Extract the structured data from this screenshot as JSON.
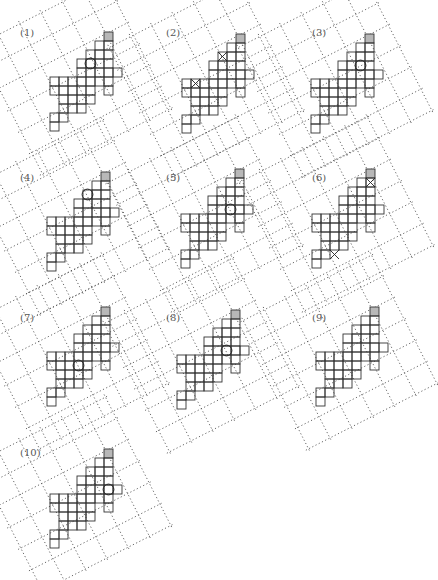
{
  "figure": {
    "cell_size": 9,
    "grid_color": "#555555",
    "cell_stroke": "#333333",
    "shaded_fill": "#b8b8b8",
    "shape_cells": [
      [
        0,
        0
      ],
      [
        -1,
        1
      ],
      [
        0,
        1
      ],
      [
        -2,
        2
      ],
      [
        -1,
        2
      ],
      [
        0,
        2
      ],
      [
        -3,
        3
      ],
      [
        -2,
        3
      ],
      [
        -1,
        3
      ],
      [
        0,
        3
      ],
      [
        -3,
        4
      ],
      [
        -2,
        4
      ],
      [
        -1,
        4
      ],
      [
        0,
        4
      ],
      [
        1,
        4
      ],
      [
        -6,
        5
      ],
      [
        -5,
        5
      ],
      [
        -4,
        5
      ],
      [
        -3,
        5
      ],
      [
        -2,
        5
      ],
      [
        -1,
        5
      ],
      [
        0,
        5
      ],
      [
        -6,
        6
      ],
      [
        -5,
        6
      ],
      [
        -4,
        6
      ],
      [
        -3,
        6
      ],
      [
        -2,
        6
      ],
      [
        0,
        6
      ],
      [
        -5,
        7
      ],
      [
        -4,
        7
      ],
      [
        -3,
        7
      ],
      [
        -2,
        7
      ],
      [
        -5,
        8
      ],
      [
        -4,
        8
      ],
      [
        -3,
        8
      ],
      [
        -6,
        9
      ],
      [
        -5,
        9
      ],
      [
        -6,
        10
      ]
    ],
    "panels": [
      {
        "label": "(1)",
        "x": 0,
        "y": 0,
        "origin": [
          104,
          32
        ],
        "marks": [
          {
            "type": "circle",
            "c": -2,
            "r": 3
          }
        ]
      },
      {
        "label": "(2)",
        "x": 146,
        "y": 0,
        "origin": [
          236,
          34
        ],
        "marks": [
          {
            "type": "x",
            "c": -2,
            "r": 2
          },
          {
            "type": "x",
            "c": -5,
            "r": 5
          }
        ]
      },
      {
        "label": "(3)",
        "x": 292,
        "y": 0,
        "origin": [
          365,
          34
        ],
        "marks": [
          {
            "type": "circle",
            "c": -1,
            "r": 3
          }
        ]
      },
      {
        "label": "(4)",
        "x": 0,
        "y": 145,
        "origin": [
          101,
          172
        ],
        "marks": [
          {
            "type": "circle",
            "c": -2,
            "r": 2
          }
        ]
      },
      {
        "label": "(5)",
        "x": 146,
        "y": 145,
        "origin": [
          235,
          169
        ],
        "marks": [
          {
            "type": "circle",
            "c": -1,
            "r": 4
          }
        ]
      },
      {
        "label": "(6)",
        "x": 292,
        "y": 145,
        "origin": [
          366,
          169
        ],
        "marks": [
          {
            "type": "x",
            "c": 0,
            "r": 1
          },
          {
            "type": "x",
            "c": -4,
            "r": 9
          }
        ]
      },
      {
        "label": "(7)",
        "x": 0,
        "y": 285,
        "origin": [
          101,
          307
        ],
        "marks": [
          {
            "type": "circle",
            "c": -3,
            "r": 6
          }
        ]
      },
      {
        "label": "(8)",
        "x": 146,
        "y": 285,
        "origin": [
          231,
          310
        ],
        "marks": [
          {
            "type": "circle",
            "c": -1,
            "r": 4
          }
        ]
      },
      {
        "label": "(9)",
        "x": 292,
        "y": 285,
        "origin": [
          370,
          307
        ],
        "marks": []
      },
      {
        "label": "(10)",
        "x": 0,
        "y": 420,
        "origin": [
          104,
          449
        ],
        "marks": [
          {
            "type": "circle",
            "c": 0,
            "r": 4
          }
        ]
      }
    ]
  }
}
